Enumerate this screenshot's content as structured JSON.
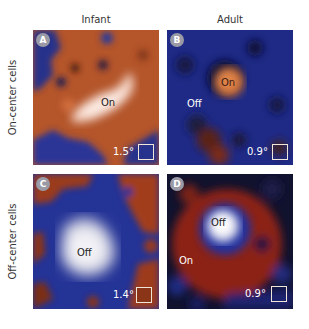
{
  "figure": {
    "columns": [
      {
        "label": "Infant"
      },
      {
        "label": "Adult"
      }
    ],
    "rows": [
      {
        "label": "On-center cells"
      },
      {
        "label": "Off-center cells"
      }
    ],
    "panels": [
      {
        "id": "A",
        "row": "On-center cells",
        "column": "Infant",
        "region_labels": [
          {
            "text": "On",
            "color": "#222222"
          }
        ],
        "scale": "1.5°",
        "background": "orange-red with blue surround"
      },
      {
        "id": "B",
        "row": "On-center cells",
        "column": "Adult",
        "region_labels": [
          {
            "text": "On",
            "color": "#3a1a10"
          },
          {
            "text": "Off",
            "color": "#ffffff"
          }
        ],
        "scale": "0.9°",
        "background": "blue with orange center"
      },
      {
        "id": "C",
        "row": "Off-center cells",
        "column": "Infant",
        "region_labels": [
          {
            "text": "Off",
            "color": "#222222"
          }
        ],
        "scale": "1.4°",
        "background": "blue/white center with red surround"
      },
      {
        "id": "D",
        "row": "Off-center cells",
        "column": "Adult",
        "region_labels": [
          {
            "text": "Off",
            "color": "#222222"
          },
          {
            "text": "On",
            "color": "#ffffff"
          }
        ],
        "scale": "0.9°",
        "background": "white center, red ring, dark blue"
      }
    ]
  },
  "colors": {
    "on_response": "#c8622e",
    "off_response": "#1f2d8a",
    "peak": "#f2e4e0"
  }
}
